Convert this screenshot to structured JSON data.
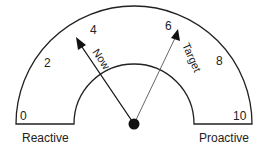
{
  "gauge": {
    "scale_labels": [
      "0",
      "2",
      "4",
      "6",
      "8",
      "10"
    ],
    "left_label": "Reactive",
    "right_label": "Proactive",
    "pointers": [
      {
        "label": "Now",
        "value": 4
      },
      {
        "label": "Target",
        "value": 6
      }
    ]
  }
}
